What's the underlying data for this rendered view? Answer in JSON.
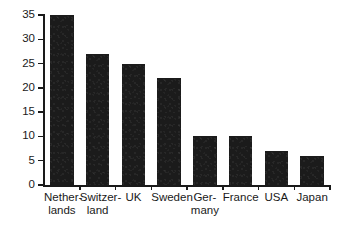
{
  "chart_data": {
    "type": "bar",
    "title": "",
    "subtitle": "",
    "xlabel": "",
    "ylabel": "",
    "categories": [
      "Nether-\nlands",
      "Switzer-\nland",
      "UK",
      "Sweden",
      "Ger-\nmany",
      "France",
      "USA",
      "Japan"
    ],
    "categories_plain": [
      "Netherlands",
      "Switzerland",
      "UK",
      "Sweden",
      "Germany",
      "France",
      "USA",
      "Japan"
    ],
    "values": [
      35,
      27,
      25,
      22,
      10,
      10,
      7,
      6
    ],
    "ylim": [
      0,
      35
    ],
    "ytick_values": [
      0,
      5,
      10,
      15,
      20,
      25,
      30,
      35
    ],
    "ytick_labels": [
      "0",
      "5",
      "10",
      "15",
      "20",
      "25",
      "30",
      "35"
    ],
    "grid": false,
    "legend": false,
    "legend_position": "none",
    "bar_color": "#1b1b1b",
    "axis_color": "#1a1a1a",
    "background_color": "#ffffff"
  }
}
